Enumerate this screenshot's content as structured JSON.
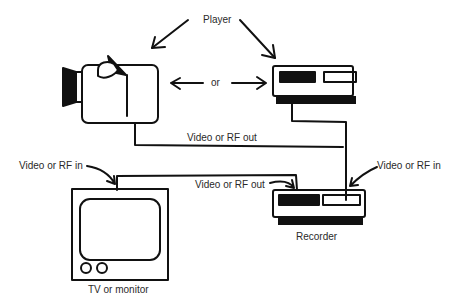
{
  "diagram": {
    "labels": {
      "player": "Player",
      "or": "or",
      "video_rf_out_top": "Video or RF out",
      "video_rf_in_left": "Video or RF in",
      "video_rf_out_mid": "Video or RF out",
      "video_rf_in_right": "Video or RF in",
      "recorder": "Recorder",
      "tv": "TV or monitor"
    },
    "nodes": [
      {
        "id": "camera",
        "label": "Camera (player)"
      },
      {
        "id": "vcr-player",
        "label": "VCR (player)"
      },
      {
        "id": "vcr-recorder",
        "label": "Recorder"
      },
      {
        "id": "tv",
        "label": "TV or monitor"
      }
    ],
    "edges": [
      {
        "from": "player",
        "to": "recorder",
        "label": "Video or RF out"
      },
      {
        "from": "recorder",
        "to": "tv",
        "label": "Video or RF out"
      }
    ],
    "colors": {
      "ink": "#111111",
      "text": "#2a2a2a",
      "background": "#ffffff"
    }
  }
}
